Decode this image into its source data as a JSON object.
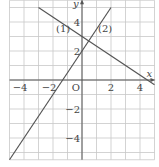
{
  "chart_data": {
    "type": "line",
    "title": "",
    "xlabel": "x",
    "ylabel": "y",
    "origin_label": "O",
    "xlim": [
      -5,
      5
    ],
    "ylim": [
      -5.5,
      5.5
    ],
    "grid": true,
    "grid_step": 1,
    "x_ticks": [
      -4,
      -2,
      2,
      4
    ],
    "x_tick_labels": [
      "−4",
      "−2",
      "2",
      "4"
    ],
    "y_ticks": [
      4,
      2,
      -2,
      -4
    ],
    "y_tick_labels": [
      "4",
      "2",
      "−2",
      "−4"
    ],
    "series": [
      {
        "name": "(1)",
        "equation": "y = -2/3 x + 3",
        "slope": -0.6667,
        "intercept": 3,
        "x": [
          -3,
          5
        ],
        "y": [
          5,
          -0.33
        ]
      },
      {
        "name": "(2)",
        "equation": "y = 3/2 x + 2",
        "slope": 1.5,
        "intercept": 2,
        "x": [
          -5,
          2
        ],
        "y": [
          -5.5,
          5
        ]
      }
    ],
    "annotations": [
      {
        "text": "(1)",
        "x": -1.3,
        "y": 3.3
      },
      {
        "text": "(2)",
        "x": 1.6,
        "y": 3.3
      }
    ],
    "colors": {
      "grid": "#c8c8c8",
      "axis": "#555555",
      "line": "#555555",
      "text": "#444444"
    }
  }
}
